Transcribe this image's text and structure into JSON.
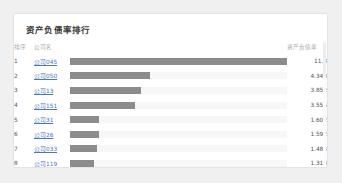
{
  "card": {
    "title": "资产负债率排行",
    "headers": {
      "rank": "排序",
      "name": "公司名",
      "bar": "",
      "value": "资产负债率"
    },
    "accent_link_color": "#4a76c4",
    "bar_color": "#8c8c8c",
    "bar_track_color": "#f7f7f7",
    "max_value": 11.8,
    "rows": [
      {
        "rank": "1",
        "name": "公司045",
        "value": "11.8",
        "value_num": 11.8
      },
      {
        "rank": "2",
        "name": "公司050",
        "value": "4.343",
        "value_num": 4.343
      },
      {
        "rank": "3",
        "name": "公司13",
        "value": "3.852",
        "value_num": 3.852
      },
      {
        "rank": "4",
        "name": "公司151",
        "value": "3.555",
        "value_num": 3.555
      },
      {
        "rank": "5",
        "name": "公司31",
        "value": "1.602",
        "value_num": 1.602
      },
      {
        "rank": "6",
        "name": "公司26",
        "value": "1.592",
        "value_num": 1.592
      },
      {
        "rank": "7",
        "name": "公司033",
        "value": "1.484",
        "value_num": 1.484
      },
      {
        "rank": "8",
        "name": "公司119",
        "value": "1.313",
        "value_num": 1.313
      }
    ]
  },
  "chart_data": {
    "type": "bar",
    "title": "资产负债率排行",
    "xlabel": "资产负债率",
    "ylabel": "公司名",
    "orientation": "horizontal",
    "grid": false,
    "legend": "none",
    "xlim": [
      0,
      11.8
    ],
    "categories": [
      "公司045",
      "公司050",
      "公司13",
      "公司151",
      "公司31",
      "公司26",
      "公司033",
      "公司119"
    ],
    "values": [
      11.8,
      4.343,
      3.852,
      3.555,
      1.602,
      1.592,
      1.484,
      1.313
    ],
    "tick_labels": [
      "11.8",
      "4.343",
      "3.852",
      "3.555",
      "1.602",
      "1.592",
      "1.484",
      "1.313"
    ]
  }
}
